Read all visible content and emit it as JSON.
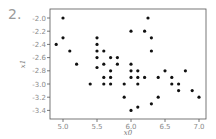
{
  "figure": {
    "number": "2."
  },
  "chart_data": {
    "type": "scatter",
    "title": "",
    "xlabel": "x0",
    "ylabel": "x1",
    "xlim": [
      4.8,
      7.1
    ],
    "ylim": [
      -3.5,
      -1.9
    ],
    "xticks": [
      5.0,
      5.5,
      6.0,
      6.5,
      7.0
    ],
    "xtick_labels": [
      "5.0",
      "5.5",
      "6.0",
      "6.5",
      "7.0"
    ],
    "yticks": [
      -2.0,
      -2.2,
      -2.4,
      -2.6,
      -2.8,
      -3.0,
      -3.2,
      -3.4
    ],
    "ytick_labels": [
      "-2.0",
      "-2.2",
      "-2.4",
      "-2.6",
      "-2.8",
      "-3.0",
      "-3.2",
      "-3.4"
    ],
    "grid": false,
    "legend": null,
    "marker_color": "#111111",
    "points": [
      [
        5.0,
        -2.0
      ],
      [
        6.25,
        -2.0
      ],
      [
        6.0,
        -2.2
      ],
      [
        6.2,
        -2.2
      ],
      [
        6.3,
        -2.3
      ],
      [
        5.0,
        -2.3
      ],
      [
        4.9,
        -2.4
      ],
      [
        5.5,
        -2.3
      ],
      [
        5.5,
        -2.4
      ],
      [
        5.1,
        -2.5
      ],
      [
        5.5,
        -2.5
      ],
      [
        5.6,
        -2.5
      ],
      [
        6.3,
        -2.5
      ],
      [
        5.5,
        -2.6
      ],
      [
        5.7,
        -2.6
      ],
      [
        5.8,
        -2.6
      ],
      [
        5.2,
        -2.7
      ],
      [
        5.6,
        -2.7
      ],
      [
        5.8,
        -2.7
      ],
      [
        6.0,
        -2.7
      ],
      [
        5.5,
        -2.75
      ],
      [
        6.0,
        -2.8
      ],
      [
        5.7,
        -2.8
      ],
      [
        6.1,
        -2.8
      ],
      [
        6.5,
        -2.8
      ],
      [
        6.8,
        -2.8
      ],
      [
        5.6,
        -2.9
      ],
      [
        5.7,
        -2.9
      ],
      [
        6.0,
        -2.9
      ],
      [
        6.1,
        -2.9
      ],
      [
        6.2,
        -2.9
      ],
      [
        6.4,
        -2.9
      ],
      [
        6.6,
        -2.9
      ],
      [
        5.4,
        -3.0
      ],
      [
        5.6,
        -3.0
      ],
      [
        5.7,
        -3.0
      ],
      [
        5.9,
        -3.0
      ],
      [
        6.1,
        -3.0
      ],
      [
        6.6,
        -3.0
      ],
      [
        6.7,
        -3.0
      ],
      [
        6.7,
        -3.1
      ],
      [
        6.9,
        -3.1
      ],
      [
        5.9,
        -3.2
      ],
      [
        6.4,
        -3.2
      ],
      [
        7.0,
        -3.2
      ],
      [
        6.3,
        -3.3
      ],
      [
        6.1,
        -3.35
      ],
      [
        6.0,
        -3.4
      ]
    ]
  }
}
